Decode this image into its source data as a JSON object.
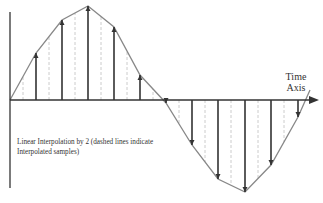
{
  "diagram": {
    "title_line1": "Time",
    "title_line2": "Axis",
    "caption_line1": "Linear Interpolation by 2 (dashed lines indicate",
    "caption_line2": "Interpolated samples)",
    "colors": {
      "waveform": "#888888",
      "stem": "#333333",
      "dashed": "#cccccc",
      "axis": "#333333"
    }
  },
  "chart_data": {
    "type": "stem",
    "title": "Linear Interpolation by 2",
    "xlabel": "Time Axis",
    "ylabel": "",
    "samples_px": [
      {
        "x": 36,
        "y": 53
      },
      {
        "x": 62,
        "y": 20
      },
      {
        "x": 88,
        "y": 6
      },
      {
        "x": 114,
        "y": 27
      },
      {
        "x": 140,
        "y": 75
      },
      {
        "x": 166,
        "y": 103
      },
      {
        "x": 192,
        "y": 145
      },
      {
        "x": 218,
        "y": 179
      },
      {
        "x": 245,
        "y": 192
      },
      {
        "x": 271,
        "y": 165
      },
      {
        "x": 298,
        "y": 117
      }
    ],
    "interpolated_x_px": [
      23,
      49,
      75,
      101,
      127,
      153,
      179,
      205,
      231,
      258,
      284
    ],
    "axis_y_px": 100
  }
}
